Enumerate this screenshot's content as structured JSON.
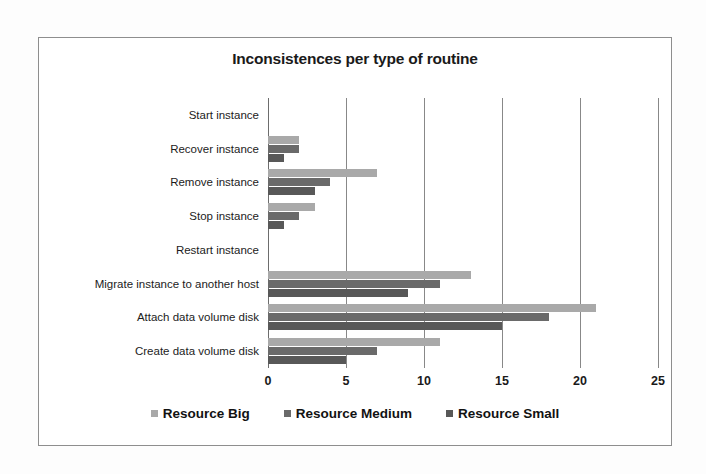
{
  "chart_data": {
    "type": "bar",
    "orientation": "horizontal",
    "title": "Inconsistences per type of routine",
    "xlabel": "",
    "ylabel": "",
    "xlim": [
      0,
      25
    ],
    "xticks": [
      0,
      5,
      10,
      15,
      20,
      25
    ],
    "grid": true,
    "legend_position": "bottom",
    "categories": [
      "Start instance",
      "Recover instance",
      "Remove instance",
      "Stop instance",
      "Restart instance",
      "Migrate instance to another host",
      "Attach data volume disk",
      "Create data volume disk"
    ],
    "series": [
      {
        "name": "Resource Big",
        "color": "#a9a9a9",
        "values": [
          0,
          2,
          7,
          3,
          0,
          13,
          21,
          11
        ]
      },
      {
        "name": "Resource Medium",
        "color": "#6a6a6a",
        "values": [
          0,
          2,
          4,
          2,
          0,
          11,
          18,
          7
        ]
      },
      {
        "name": "Resource Small",
        "color": "#585858",
        "values": [
          0,
          1,
          3,
          1,
          0,
          9,
          15,
          5
        ]
      }
    ]
  },
  "legend": {
    "items": [
      {
        "label": "Resource Big",
        "swatch": "big"
      },
      {
        "label": "Resource Medium",
        "swatch": "medium"
      },
      {
        "label": "Resource Small",
        "swatch": "small"
      }
    ]
  }
}
